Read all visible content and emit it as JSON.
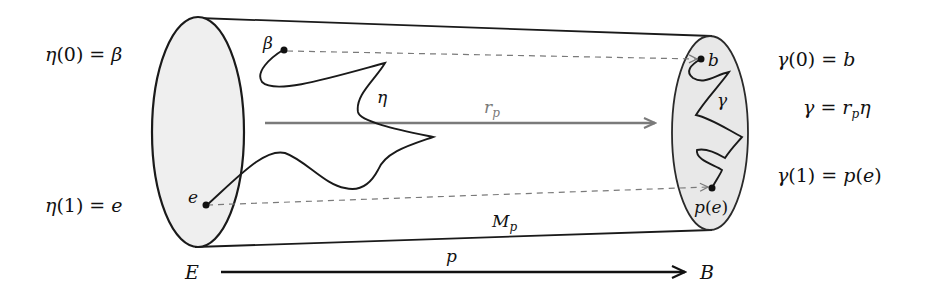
{
  "diagram": {
    "left_labels": {
      "eta0": {
        "func": "η",
        "arg": "(0)",
        "eq": " = ",
        "rhs": "β"
      },
      "eta1": {
        "func": "η",
        "arg": "(1)",
        "eq": " = ",
        "rhs": "e"
      }
    },
    "right_labels": {
      "gamma0": {
        "func": "γ",
        "arg": "(0)",
        "eq": " = ",
        "rhs": "b"
      },
      "gamma_def": {
        "lhs": "γ",
        "eq": " = ",
        "r": "r",
        "sub": "p",
        "rhs": "η"
      },
      "gamma1": {
        "func": "γ",
        "arg": "(1)",
        "eq": " = ",
        "rhs_func": "p",
        "rhs_arg_open": "(",
        "rhs_arg": "e",
        "rhs_arg_close": ")"
      }
    },
    "cylinder": {
      "label_main": "M",
      "label_sub": "p",
      "left_disk_fill": "#efefef",
      "right_disk_fill": "#e8e8e8",
      "stroke": "#1a1a1a"
    },
    "points": {
      "beta": "β",
      "e": "e",
      "b": "b",
      "pe_func": "p",
      "pe_open": "(",
      "pe_arg": "e",
      "pe_close": ")"
    },
    "curves": {
      "eta_label": "η",
      "gamma_label": "γ"
    },
    "arrows": {
      "retraction": {
        "label": "r",
        "sub": "p",
        "color": "#7a7a7a"
      },
      "projection": {
        "label": "p",
        "from": "E",
        "to": "B",
        "color": "#111111"
      }
    }
  }
}
